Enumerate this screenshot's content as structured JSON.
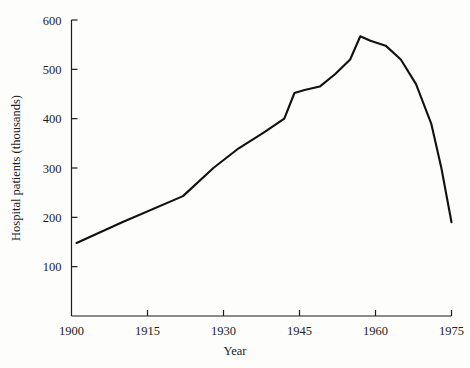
{
  "chart_data": {
    "type": "line",
    "title": "",
    "xlabel": "Year",
    "ylabel": "Hospital patients (thousands)",
    "xlim": [
      1900,
      1975
    ],
    "ylim": [
      0,
      600
    ],
    "xticks": [
      1900,
      1915,
      1930,
      1945,
      1960,
      1975
    ],
    "xtick_labels": [
      "1900",
      "1915",
      "1930",
      "1945",
      "1960",
      "1975"
    ],
    "yticks": [
      100,
      200,
      300,
      400,
      500,
      600
    ],
    "ytick_labels": [
      "100",
      "200",
      "300",
      "400",
      "500",
      "600"
    ],
    "grid": false,
    "legend": false,
    "series": [
      {
        "name": "Hospital patients",
        "x": [
          1901,
          1910,
          1922,
          1928,
          1933,
          1938,
          1942,
          1944,
          1946,
          1949,
          1952,
          1955,
          1957,
          1959,
          1962,
          1965,
          1968,
          1971,
          1973,
          1975
        ],
        "values": [
          148,
          190,
          243,
          300,
          340,
          372,
          400,
          452,
          458,
          465,
          490,
          520,
          567,
          558,
          548,
          520,
          470,
          390,
          300,
          190
        ]
      }
    ]
  },
  "axes": {
    "x_axis_label": "Year",
    "y_axis_label": "Hospital patients (thousands)"
  }
}
